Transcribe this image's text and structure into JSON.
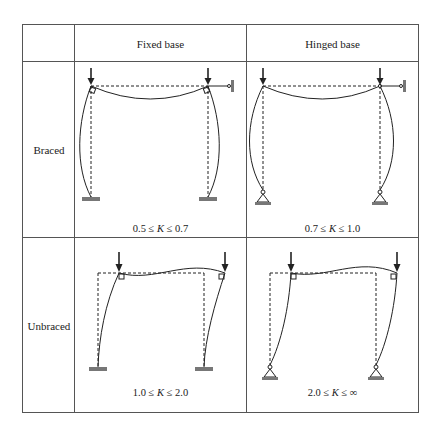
{
  "table": {
    "columns": [
      {
        "label": ""
      },
      {
        "label": "Fixed base"
      },
      {
        "label": "Hinged base"
      }
    ],
    "rows": [
      {
        "label": "Braced",
        "cells": [
          {
            "support": "fixed",
            "sway": false,
            "k_range": {
              "lower": "0.5",
              "var": "K",
              "upper": "0.7",
              "op": "≤"
            }
          },
          {
            "support": "hinged",
            "sway": false,
            "k_range": {
              "lower": "0.7",
              "var": "K",
              "upper": "1.0",
              "op": "≤"
            }
          }
        ]
      },
      {
        "label": "Unbraced",
        "cells": [
          {
            "support": "fixed",
            "sway": true,
            "k_range": {
              "lower": "1.0",
              "var": "K",
              "upper": "2.0",
              "op": "≤"
            }
          },
          {
            "support": "hinged",
            "sway": true,
            "k_range": {
              "lower": "2.0",
              "var": "K",
              "upper": "∞",
              "op": "≤"
            }
          }
        ]
      }
    ]
  },
  "colors": {
    "line": "#222222",
    "border": "#555555",
    "ground": "#777777"
  }
}
